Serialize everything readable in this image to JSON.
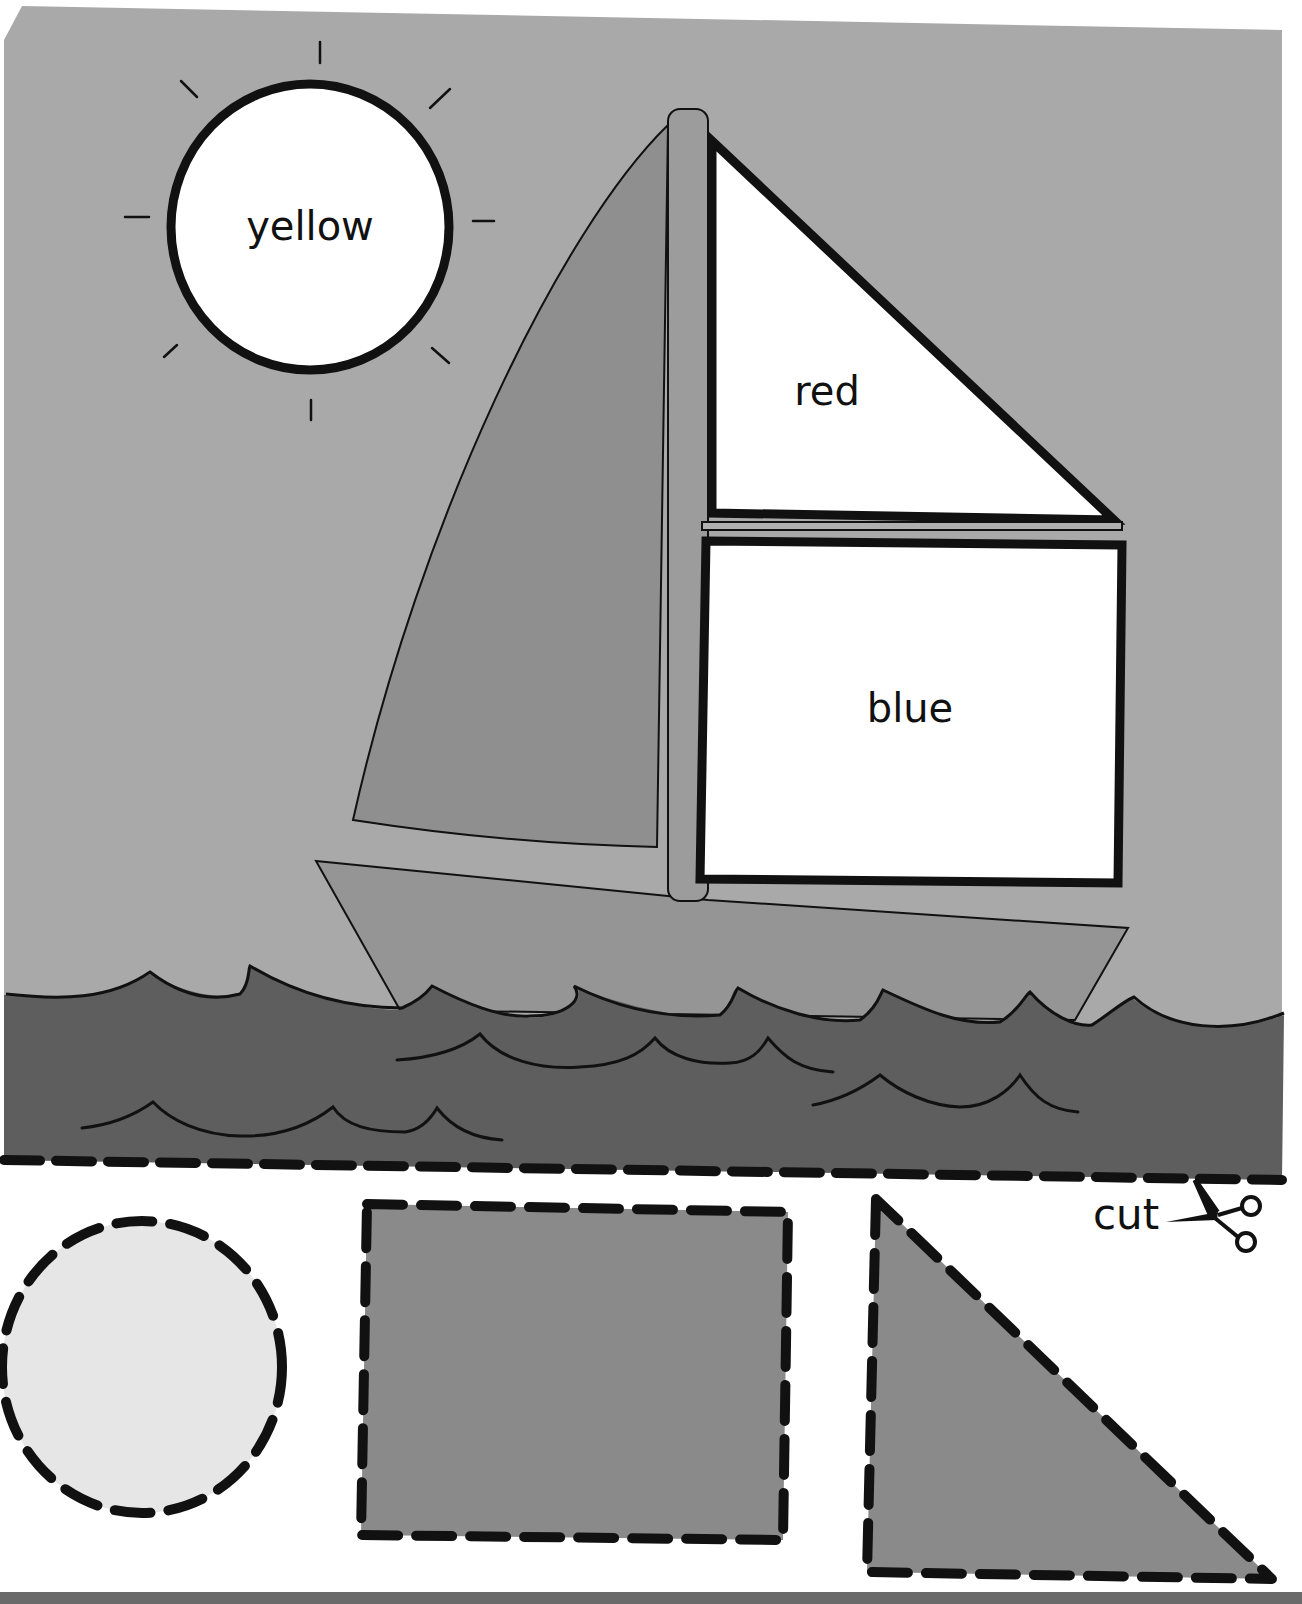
{
  "worksheet": {
    "scene": {
      "sky_color": "#a9a9a9",
      "water_color": "#5e5e5e",
      "sun": {
        "label": "yellow",
        "fill": "#ffffff"
      },
      "jib_sail": {
        "fill": "#8f8f8f"
      },
      "top_sail": {
        "label": "red",
        "fill": "#ffffff"
      },
      "main_sail": {
        "label": "blue",
        "fill": "#ffffff"
      },
      "hull": {
        "fill": "#959595"
      },
      "mast": {
        "fill": "#9c9c9c"
      }
    },
    "cut_line": {
      "label": "cut",
      "icon": "scissors-icon"
    },
    "cutouts": [
      {
        "shape": "circle",
        "fill": "#e6e6e6"
      },
      {
        "shape": "rectangle",
        "fill": "#8a8a8a"
      },
      {
        "shape": "triangle",
        "fill": "#8a8a8a"
      }
    ],
    "bottom_bar_color": "#6a6a6a"
  }
}
